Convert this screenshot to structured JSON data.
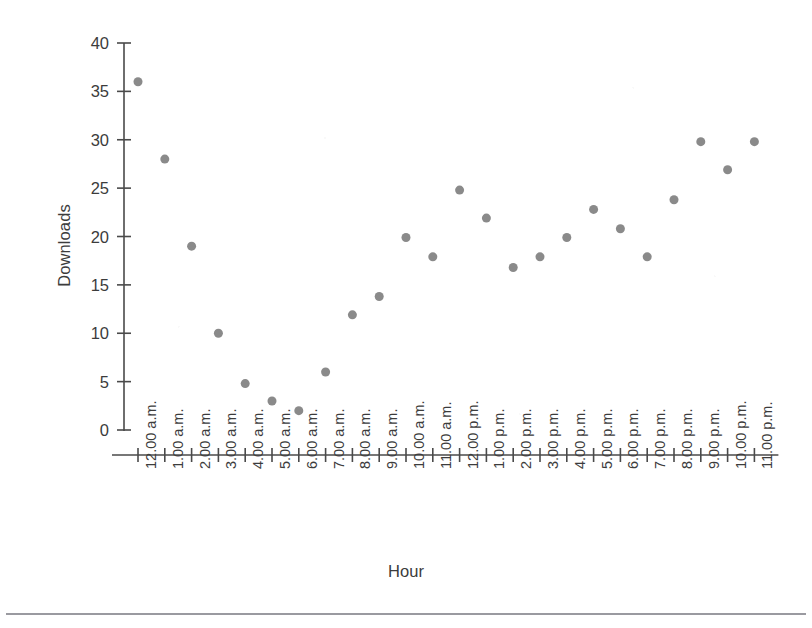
{
  "chart_data": {
    "type": "scatter",
    "title": "",
    "xlabel": "Hour",
    "ylabel": "Downloads",
    "ylim": [
      0,
      40
    ],
    "yticks": [
      0,
      5,
      10,
      15,
      20,
      25,
      30,
      35,
      40
    ],
    "grid": false,
    "legend": null,
    "marker": {
      "shape": "circle",
      "color": "#8a8a8a",
      "size": 9
    },
    "categories": [
      "12.00 a.m.",
      "1.00 a.m.",
      "2.00 a.m.",
      "3.00 a.m.",
      "4.00 a.m.",
      "5.00 a.m.",
      "6.00 a.m.",
      "7.00 a.m.",
      "8.00 a.m.",
      "9.00 a.m.",
      "10.00 a.m.",
      "11.00 a.m.",
      "12.00 p.m.",
      "1.00 p.m.",
      "2.00 p.m.",
      "3.00 p.m.",
      "4.00 p.m.",
      "5.00 p.m.",
      "6.00 p.m.",
      "7.00 p.m.",
      "8.00 p.m.",
      "9.00 p.m.",
      "10.00 p.m.",
      "11.00 p.m."
    ],
    "values": [
      36.0,
      28.0,
      19.0,
      10.0,
      4.8,
      3.0,
      2.0,
      6.0,
      11.9,
      13.8,
      19.9,
      17.9,
      24.8,
      21.9,
      16.8,
      17.9,
      19.9,
      22.8,
      20.8,
      17.9,
      23.8,
      29.8,
      26.9,
      29.8
    ]
  },
  "figure": {
    "background_color": "#ffffff",
    "axis_color": "#4a4a4a",
    "text_color": "#3c3c3c",
    "marker_color": "#8a8a8a",
    "rule_color": "#9a9aa0"
  }
}
